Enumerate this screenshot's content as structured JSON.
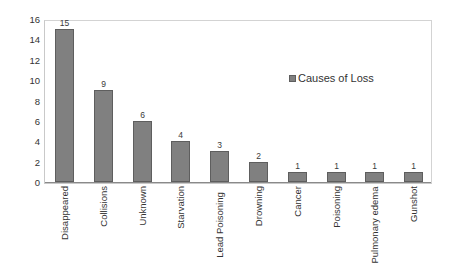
{
  "chart_data": {
    "type": "bar",
    "title": "",
    "xlabel": "",
    "ylabel": "Number of condors",
    "ylim": [
      0,
      16
    ],
    "ytick_step": 2,
    "yticks": [
      "0",
      "2",
      "4",
      "6",
      "8",
      "10",
      "12",
      "14",
      "16"
    ],
    "grid": false,
    "legend_position": "upper-right-inside",
    "legend_entries": [
      "Causes of Loss"
    ],
    "series_name": "Causes of Loss",
    "bar_color": "#808080",
    "bar_border_color": "#5e5e5e",
    "categories": [
      "Disappeared",
      "Collisions",
      "Unknown",
      "Starvation",
      "Lead Poisoning",
      "Drowning",
      "Cancer",
      "Poisoning",
      "Pulmonary edema",
      "Gunshot"
    ],
    "values": [
      15,
      9,
      6,
      4,
      3,
      2,
      1,
      1,
      1,
      1
    ],
    "value_labels": [
      "15",
      "9",
      "6",
      "4",
      "3",
      "2",
      "1",
      "1",
      "1",
      "1"
    ]
  }
}
